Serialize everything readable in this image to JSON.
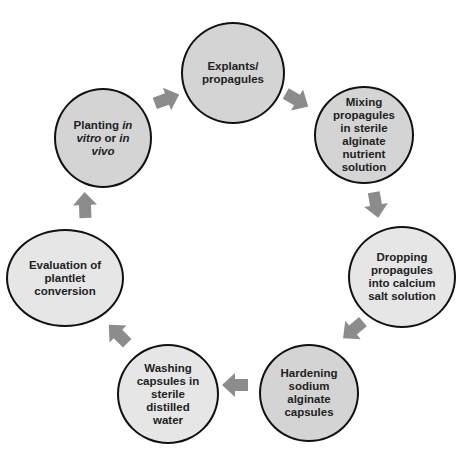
{
  "diagram": {
    "type": "cycle",
    "colors": {
      "node_fill_dark": "#d4d4d4",
      "node_fill_light": "#e6e6e6",
      "node_border": "#111111",
      "arrow": "#8c8c8c",
      "text": "#222222"
    },
    "nodes": [
      {
        "id": "explants",
        "lines": [
          "Explants/",
          "propagules"
        ]
      },
      {
        "id": "mixing",
        "lines": [
          "Mixing",
          "propagules",
          "in sterile",
          "alginate",
          "nutrient",
          "solution"
        ]
      },
      {
        "id": "dropping",
        "lines": [
          "Dropping",
          "propagules",
          "into calcium",
          "salt solution"
        ]
      },
      {
        "id": "hardening",
        "lines": [
          "Hardening",
          "sodium",
          "alginate",
          "capsules"
        ]
      },
      {
        "id": "washing",
        "lines": [
          "Washing",
          "capsules in",
          "sterile",
          "distilled",
          "water"
        ]
      },
      {
        "id": "evaluation",
        "lines": [
          "Evaluation of",
          "plantlet",
          "conversion"
        ]
      },
      {
        "id": "planting",
        "line1_a": "Planting ",
        "line1_b": "in",
        "line2_a": "vitro",
        "line2_b": " or ",
        "line2_c": "in",
        "line3": "vivo"
      }
    ],
    "arrows": [
      {
        "from": "explants",
        "to": "mixing",
        "icon": "arrow-icon"
      },
      {
        "from": "mixing",
        "to": "dropping",
        "icon": "arrow-icon"
      },
      {
        "from": "dropping",
        "to": "hardening",
        "icon": "arrow-icon"
      },
      {
        "from": "hardening",
        "to": "washing",
        "icon": "arrow-icon"
      },
      {
        "from": "washing",
        "to": "evaluation",
        "icon": "arrow-icon"
      },
      {
        "from": "evaluation",
        "to": "planting",
        "icon": "arrow-icon"
      },
      {
        "from": "planting",
        "to": "explants",
        "icon": "arrow-icon"
      }
    ]
  }
}
